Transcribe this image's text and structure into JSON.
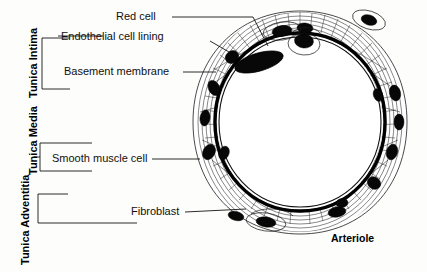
{
  "figure": {
    "caption": "Arteriole",
    "background_color": "#fdfdfb",
    "ink_color": "#101010"
  },
  "layer_labels": [
    {
      "id": "tunica-intima",
      "text": "Tunica Intima"
    },
    {
      "id": "tunica-media",
      "text": "Tunica Media"
    },
    {
      "id": "tunica-adventitia",
      "text": "Tunica Adventitia"
    }
  ],
  "callouts": [
    {
      "id": "red-cell",
      "text": "Red cell"
    },
    {
      "id": "endothelial-cell-lining",
      "text": "Endothelial cell lining"
    },
    {
      "id": "basement-membrane",
      "text": "Basement membrane"
    },
    {
      "id": "smooth-muscle-cell",
      "text": "Smooth muscle cell"
    },
    {
      "id": "fibroblast",
      "text": "Fibroblast"
    }
  ],
  "illustration": {
    "subject": "arteriole-cross-section",
    "description": "Ink drawing of an arteriole in transverse section showing lumen, endothelial lining, basement membrane, circular smooth muscle layer and outer fibroblast-rich adventitia"
  }
}
